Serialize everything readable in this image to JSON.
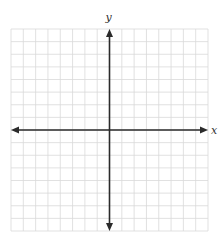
{
  "diagram": {
    "type": "coordinate-plane",
    "x_axis_label": "x",
    "y_axis_label": "y",
    "grid": {
      "columns": 16,
      "rows": 16,
      "left": 11,
      "top": 29,
      "right": 208,
      "bottom": 231,
      "line_color": "#d9d9d9"
    },
    "axis_color": "#2b2b2b",
    "origin_col": 8,
    "origin_row": 8
  }
}
